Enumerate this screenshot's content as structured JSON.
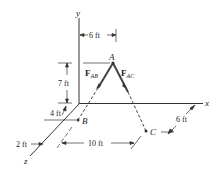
{
  "diagram": {
    "axes": {
      "x": "x",
      "y": "y",
      "z": "z"
    },
    "points": {
      "A": "A",
      "B": "B",
      "C": "C"
    },
    "forces": {
      "ab_main": "F",
      "ab_sub": "AB",
      "ac_main": "F",
      "ac_sub": "AC"
    },
    "dimensions": {
      "top_6ft": "6 ft",
      "height_7ft": "7 ft",
      "depth_4ft": "4 ft",
      "depth_2ft": "2 ft",
      "span_10ft": "10 ft",
      "right_6ft": "6 ft"
    },
    "colors": {
      "line": "#333333",
      "member": "#555555"
    }
  }
}
